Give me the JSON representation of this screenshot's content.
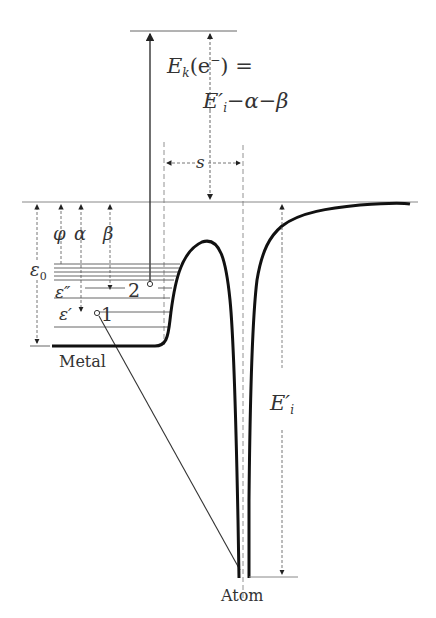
{
  "diagram": {
    "labels": {
      "kinetic_energy_lhs": "E",
      "kinetic_energy_sub": "k",
      "kinetic_energy_paren": "(e",
      "kinetic_energy_sup": "−",
      "kinetic_energy_close": ") =",
      "kinetic_energy_rhs_E": "E",
      "kinetic_energy_rhs_prime": "′",
      "kinetic_energy_rhs_sub": "i",
      "kinetic_energy_rhs_rest": "−α−β",
      "distance": "s",
      "epsilon0": "ε",
      "epsilon0_sub": "0",
      "phi": "φ",
      "alpha": "α",
      "beta": "β",
      "epsilon_double_prime": "ε″",
      "epsilon_prime": "ε′",
      "level_2": "2",
      "level_1": "1",
      "metal": "Metal",
      "ionization_E": "E",
      "ionization_prime": "′",
      "ionization_sub": "i",
      "atom": "Atom"
    },
    "colors": {
      "curve": "#111111",
      "thin_line": "#555555",
      "dashed": "#666666",
      "text": "#333333"
    }
  }
}
